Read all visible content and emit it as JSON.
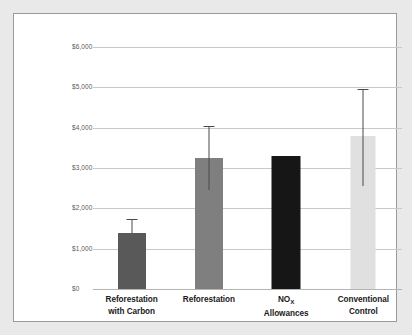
{
  "figure": {
    "background_color": "#e9e9e9",
    "card_color": "#ffffff",
    "border_color": "#9a9a9a"
  },
  "axis": {
    "y_title_main": "Cost / Ton NO",
    "y_title_sub": "x",
    "y_ticks": [
      "$0",
      "$1,000",
      "$2,000",
      "$3,000",
      "$4,000",
      "$5,000",
      "$6,000"
    ]
  },
  "categories": [
    {
      "line1": "Reforestation",
      "line2": "with Carbon",
      "sub": ""
    },
    {
      "line1": "Reforestation",
      "line2": "",
      "sub": ""
    },
    {
      "line1": "NO",
      "sub": "X",
      "line2": "Allowances"
    },
    {
      "line1": "Conventional",
      "line2": "Control",
      "sub": ""
    }
  ],
  "chart_data": {
    "type": "bar",
    "title": "",
    "xlabel": "",
    "ylabel": "Cost / Ton NOx",
    "ylim": [
      0,
      6000
    ],
    "ytick_values": [
      0,
      1000,
      2000,
      3000,
      4000,
      5000,
      6000
    ],
    "ytick_labels": [
      "$0",
      "$1,000",
      "$2,000",
      "$3,000",
      "$4,000",
      "$5,000",
      "$6,000"
    ],
    "grid": true,
    "legend": "none",
    "categories": [
      "Reforestation with Carbon",
      "Reforestation",
      "NOx Allowances",
      "Conventional Control"
    ],
    "values": [
      1390,
      3250,
      3300,
      3800
    ],
    "error_high": [
      1740,
      4050,
      null,
      4950
    ],
    "error_low": [
      null,
      2450,
      null,
      2550
    ],
    "bar_colors": [
      "#595959",
      "#7f7f7f",
      "#161616",
      "#e0e0e0"
    ],
    "error_bar_color": "#4a4a4a",
    "units": "USD per ton NOx"
  }
}
